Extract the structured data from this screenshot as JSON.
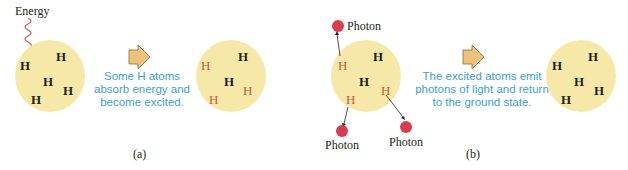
{
  "panel_a": {
    "energy_label": "Energy",
    "before_atoms": [
      {
        "symbol": "H",
        "state": "ground",
        "x": 20,
        "y": 59
      },
      {
        "symbol": "H",
        "state": "ground",
        "x": 56,
        "y": 50
      },
      {
        "symbol": "H",
        "state": "ground",
        "x": 43,
        "y": 75
      },
      {
        "symbol": "H",
        "state": "ground",
        "x": 63,
        "y": 84
      },
      {
        "symbol": "H",
        "state": "ground",
        "x": 31,
        "y": 93
      }
    ],
    "transition_text_lines": [
      "Some H atoms",
      "absorb energy and",
      "become excited."
    ],
    "after_atoms": [
      {
        "symbol": "H",
        "state": "excited",
        "x": 201,
        "y": 59
      },
      {
        "symbol": "H",
        "state": "ground",
        "x": 238,
        "y": 50
      },
      {
        "symbol": "H",
        "state": "ground",
        "x": 224,
        "y": 75
      },
      {
        "symbol": "H",
        "state": "excited",
        "x": 243,
        "y": 84
      },
      {
        "symbol": "H",
        "state": "excited",
        "x": 209,
        "y": 93
      }
    ],
    "sublabel": "(a)"
  },
  "panel_b": {
    "photon_label": "Photon",
    "photon_labels": [
      "Photon",
      "Photon",
      "Photon"
    ],
    "before_atoms": [
      {
        "symbol": "H",
        "state": "excited",
        "x": 338,
        "y": 59
      },
      {
        "symbol": "H",
        "state": "ground",
        "x": 373,
        "y": 50
      },
      {
        "symbol": "H",
        "state": "ground",
        "x": 359,
        "y": 75
      },
      {
        "symbol": "H",
        "state": "excited",
        "x": 381,
        "y": 84
      },
      {
        "symbol": "H",
        "state": "excited",
        "x": 346,
        "y": 93
      }
    ],
    "transition_text_lines": [
      "The excited atoms emit",
      "photons of light and return",
      "to the ground state."
    ],
    "after_atoms": [
      {
        "symbol": "H",
        "state": "ground",
        "x": 552,
        "y": 59
      },
      {
        "symbol": "H",
        "state": "ground",
        "x": 588,
        "y": 50
      },
      {
        "symbol": "H",
        "state": "ground",
        "x": 574,
        "y": 75
      },
      {
        "symbol": "H",
        "state": "ground",
        "x": 594,
        "y": 84
      },
      {
        "symbol": "H",
        "state": "ground",
        "x": 561,
        "y": 93
      }
    ],
    "sublabel": "(b)"
  },
  "colors": {
    "atom_cloud": "#f6e9a8",
    "ground_state_text": "#231f20",
    "excited_state_text": "#d2553a",
    "caption_text": "#3aa0d8",
    "photon": "#dc3b4e",
    "arrow_fill": "#eec27a",
    "energy_wave": "#d2553a"
  }
}
